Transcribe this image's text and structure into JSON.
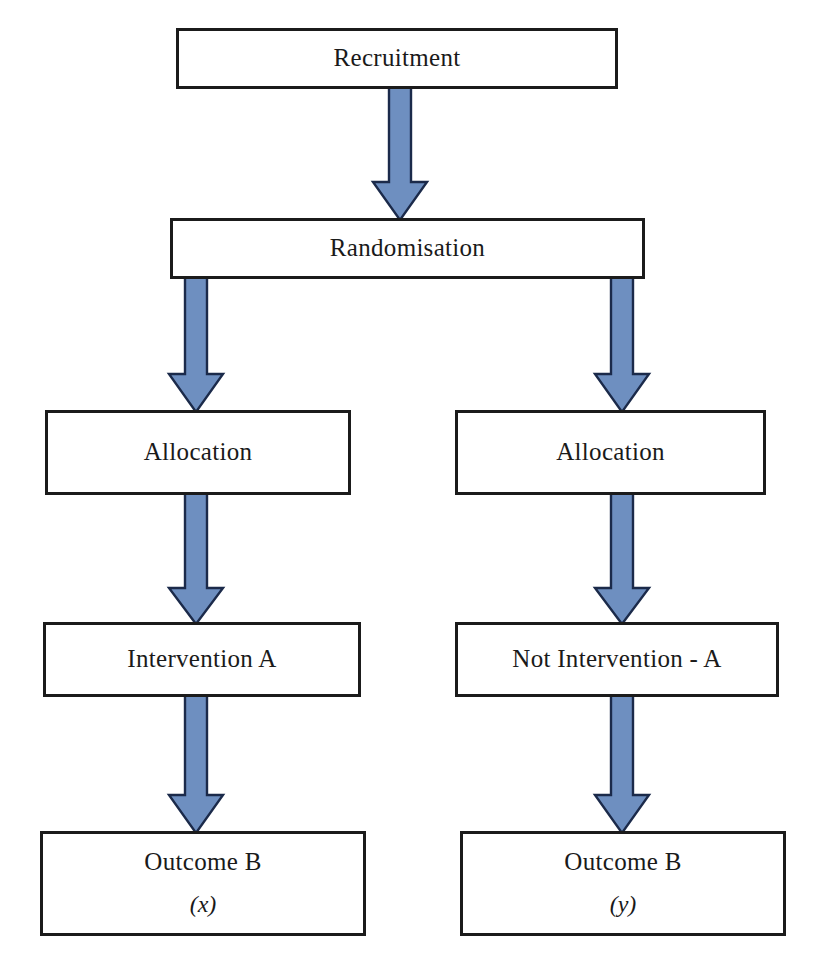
{
  "diagram": {
    "type": "flowchart",
    "orientation": "top-to-bottom",
    "colors": {
      "arrow_fill": "#6e8fc0",
      "arrow_stroke": "#1b2a4a",
      "box_border": "#1b1b1b",
      "box_fill": "#ffffff",
      "text": "#1a1a1a"
    },
    "nodes": [
      {
        "id": "recruitment",
        "label": "Recruitment",
        "sublabel": ""
      },
      {
        "id": "randomisation",
        "label": "Randomisation",
        "sublabel": ""
      },
      {
        "id": "allocation-left",
        "label": "Allocation",
        "sublabel": ""
      },
      {
        "id": "allocation-right",
        "label": "Allocation",
        "sublabel": ""
      },
      {
        "id": "intervention-a",
        "label": "Intervention A",
        "sublabel": ""
      },
      {
        "id": "not-intervention-a",
        "label": "Not Intervention - A",
        "sublabel": ""
      },
      {
        "id": "outcome-left",
        "label": "Outcome B",
        "sublabel": "(x)"
      },
      {
        "id": "outcome-right",
        "label": "Outcome B",
        "sublabel": "(y)"
      }
    ],
    "edges": [
      {
        "id": "edge-recruitment-randomisation",
        "from": "recruitment",
        "to": "randomisation",
        "icon": "down-arrow-icon"
      },
      {
        "id": "edge-randomisation-allocation-left",
        "from": "randomisation",
        "to": "allocation-left",
        "icon": "down-arrow-icon"
      },
      {
        "id": "edge-randomisation-allocation-right",
        "from": "randomisation",
        "to": "allocation-right",
        "icon": "down-arrow-icon"
      },
      {
        "id": "edge-allocation-left-intervention",
        "from": "allocation-left",
        "to": "intervention-a",
        "icon": "down-arrow-icon"
      },
      {
        "id": "edge-allocation-right-intervention",
        "from": "allocation-right",
        "to": "not-intervention-a",
        "icon": "down-arrow-icon"
      },
      {
        "id": "edge-intervention-outcome-left",
        "from": "intervention-a",
        "to": "outcome-left",
        "icon": "down-arrow-icon"
      },
      {
        "id": "edge-intervention-outcome-right",
        "from": "not-intervention-a",
        "to": "outcome-right",
        "icon": "down-arrow-icon"
      }
    ]
  }
}
